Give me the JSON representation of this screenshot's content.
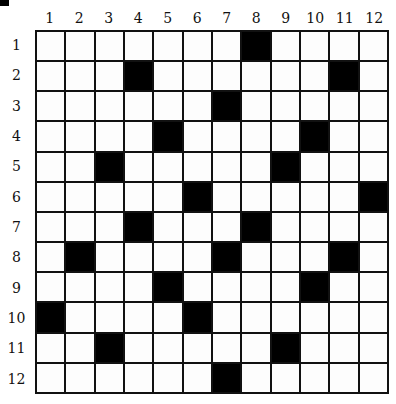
{
  "puzzle": {
    "rows": 12,
    "cols": 12,
    "column_labels": [
      "1",
      "2",
      "3",
      "4",
      "5",
      "6",
      "7",
      "8",
      "9",
      "10",
      "11",
      "12"
    ],
    "row_labels": [
      "1",
      "2",
      "3",
      "4",
      "5",
      "6",
      "7",
      "8",
      "9",
      "10",
      "11",
      "12"
    ],
    "black_cells": [
      [
        1,
        8
      ],
      [
        2,
        4
      ],
      [
        2,
        11
      ],
      [
        3,
        7
      ],
      [
        4,
        5
      ],
      [
        4,
        10
      ],
      [
        5,
        3
      ],
      [
        5,
        9
      ],
      [
        6,
        6
      ],
      [
        6,
        12
      ],
      [
        7,
        4
      ],
      [
        7,
        8
      ],
      [
        8,
        2
      ],
      [
        8,
        7
      ],
      [
        8,
        11
      ],
      [
        9,
        5
      ],
      [
        9,
        10
      ],
      [
        10,
        1
      ],
      [
        10,
        6
      ],
      [
        11,
        3
      ],
      [
        11,
        9
      ],
      [
        12,
        7
      ]
    ],
    "colors": {
      "black": "#000000",
      "white": "#fdfdfd",
      "line": "#111111"
    }
  }
}
